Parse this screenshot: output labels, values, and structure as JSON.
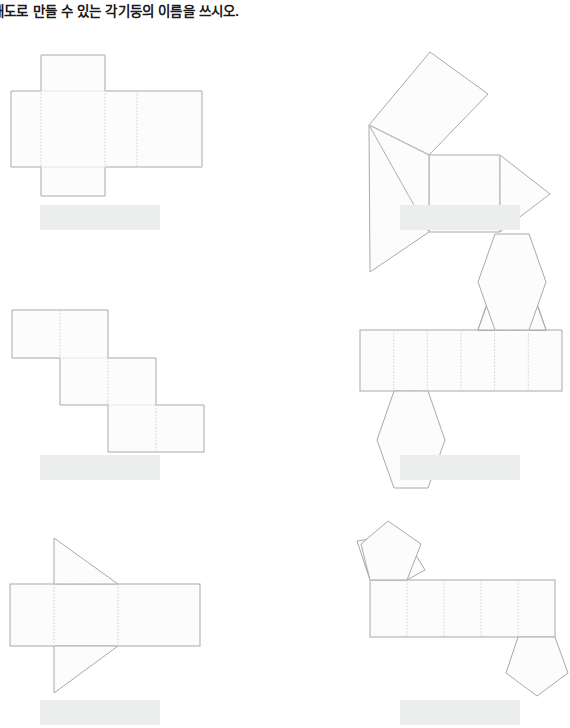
{
  "page": {
    "width": 570,
    "height": 728,
    "background": "#ffffff",
    "title": "개도로 만들 수 있는 각기둥의 이름을 쓰시오.",
    "title_note": "left edge of first character is clipped by the page crop"
  },
  "style": {
    "solid_edge_color": "#a9a9a9",
    "fold_edge_color": "#d2d2d2",
    "face_fill_color": "#fcfcfc",
    "answer_box_color": "#eceded",
    "title_color": "#1a1a1a"
  },
  "problems": [
    {
      "id": "net-1",
      "position": "top-left",
      "shape_label": "cross-shaped rectangular prism net",
      "faces": 6,
      "answer_value": "",
      "answer_placeholder": ""
    },
    {
      "id": "net-2",
      "position": "top-right",
      "shape_label": "pinwheel triangular prism net",
      "faces": 5,
      "answer_value": "",
      "answer_placeholder": ""
    },
    {
      "id": "net-3",
      "position": "middle-left",
      "shape_label": "staircase rectangular prism net",
      "faces": 6,
      "answer_value": "",
      "answer_placeholder": ""
    },
    {
      "id": "net-4",
      "position": "middle-right",
      "shape_label": "hexagonal prism net",
      "faces": 8,
      "answer_value": "",
      "answer_placeholder": ""
    },
    {
      "id": "net-5",
      "position": "bottom-left",
      "shape_label": "triangular prism net with bowtie triangles",
      "faces": 5,
      "answer_value": "",
      "answer_placeholder": ""
    },
    {
      "id": "net-6",
      "position": "bottom-right",
      "shape_label": "pentagonal prism net",
      "faces": 7,
      "answer_value": "",
      "answer_placeholder": ""
    }
  ],
  "answer_boxes": [
    {
      "id": "answer-1",
      "x": 40,
      "y": 205,
      "width": 120,
      "height": 25
    },
    {
      "id": "answer-2",
      "x": 400,
      "y": 205,
      "width": 120,
      "height": 25
    },
    {
      "id": "answer-3",
      "x": 40,
      "y": 455,
      "width": 120,
      "height": 25
    },
    {
      "id": "answer-4",
      "x": 400,
      "y": 455,
      "width": 120,
      "height": 25
    },
    {
      "id": "answer-5",
      "x": 40,
      "y": 700,
      "width": 120,
      "height": 25
    },
    {
      "id": "answer-6",
      "x": 400,
      "y": 700,
      "width": 120,
      "height": 25
    }
  ]
}
